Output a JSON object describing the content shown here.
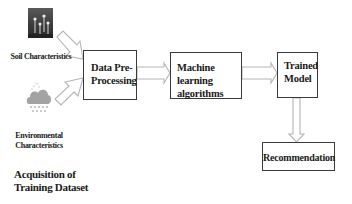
{
  "diagram": {
    "type": "flowchart",
    "inputs": {
      "soil": {
        "label": "Soil Characteristics",
        "icon": "soil-photo-icon"
      },
      "environment": {
        "label_line1": "Environmental",
        "label_line2": "Characteristics",
        "icon": "rain-cloud-icon"
      },
      "group_label_line1": "Acquisition of",
      "group_label_line2": "Training Dataset"
    },
    "nodes": [
      {
        "id": "preprocess",
        "line1": "Data Pre-",
        "line2": "Processing"
      },
      {
        "id": "ml",
        "line1": "Machine learning",
        "line2": "algorithms"
      },
      {
        "id": "model",
        "line1": "Trained",
        "line2": "Model"
      },
      {
        "id": "recommendation",
        "line1": "Recommendation"
      }
    ],
    "edges": [
      {
        "from": "soil",
        "to": "preprocess"
      },
      {
        "from": "environment",
        "to": "preprocess"
      },
      {
        "from": "preprocess",
        "to": "ml"
      },
      {
        "from": "ml",
        "to": "model"
      },
      {
        "from": "model",
        "to": "recommendation"
      }
    ],
    "colors": {
      "box_border": "#3a3a3a",
      "arrow": "#b8b8b8",
      "text": "#1a1a1a"
    }
  }
}
